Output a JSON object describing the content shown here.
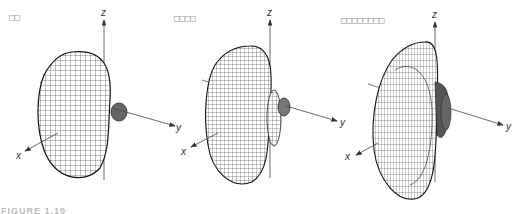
{
  "figure": {
    "caption_partial": "FIGURE 1.10",
    "panels": [
      {
        "label": "□□",
        "axes": {
          "x": "x",
          "y": "y",
          "z": "z"
        },
        "description": "3D radiation pattern, main lobe with one side lobe"
      },
      {
        "label": "□□□□",
        "axes": {
          "x": "x",
          "y": "y",
          "z": "z"
        },
        "description": "3D radiation pattern, narrower main lobe with multiple side lobes"
      },
      {
        "label": "□□□□□□□□",
        "axes": {
          "x": "x",
          "y": "y",
          "z": "z"
        },
        "description": "3D radiation pattern, flattened disk main lobe with many side lobes"
      }
    ],
    "colors": {
      "mesh": "#222222",
      "axis": "#444444",
      "label": "#9a9a9a",
      "background": "#ffffff"
    }
  }
}
